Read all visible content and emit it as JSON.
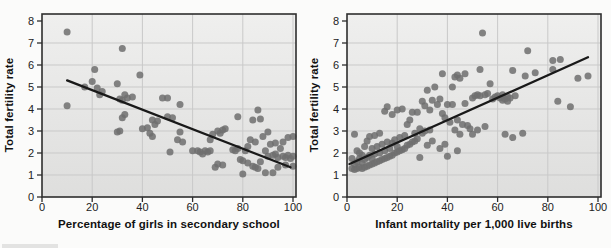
{
  "style": {
    "dot_color": "#6f6f6f",
    "trend_color": "#191919",
    "grid_color": "#c9c9c9",
    "axis_color": "#2e2e2e",
    "plot_bg_top": "#efefee",
    "plot_bg_bottom": "#dededd",
    "text_color": "#1c1c1c"
  },
  "chart_data": [
    {
      "type": "scatter",
      "title": "",
      "xlabel": "Percentage of girls in secondary school",
      "ylabel": "Total fertility rate",
      "xlim": [
        0,
        100
      ],
      "ylim": [
        0,
        8
      ],
      "xticks": [
        0,
        20,
        40,
        60,
        80,
        100
      ],
      "yticks": [
        0,
        1,
        2,
        3,
        4,
        5,
        6,
        7,
        8
      ],
      "grid": true,
      "legend": false,
      "trend_line": {
        "x1": 10,
        "y1": 5.3,
        "x2": 99,
        "y2": 1.35
      },
      "points": [
        [
          10,
          7.5
        ],
        [
          32,
          6.75
        ],
        [
          21,
          5.8
        ],
        [
          39,
          5.55
        ],
        [
          20,
          5.25
        ],
        [
          30,
          5.15
        ],
        [
          17,
          5.0
        ],
        [
          22,
          4.95
        ],
        [
          24,
          4.8
        ],
        [
          23,
          4.65
        ],
        [
          33,
          4.65
        ],
        [
          36,
          4.55
        ],
        [
          34,
          4.5
        ],
        [
          31,
          4.45
        ],
        [
          32,
          4.4
        ],
        [
          48,
          4.5
        ],
        [
          50,
          4.5
        ],
        [
          55,
          4.2
        ],
        [
          10,
          4.15
        ],
        [
          33,
          3.75
        ],
        [
          50,
          3.65
        ],
        [
          32,
          3.6
        ],
        [
          52,
          3.6
        ],
        [
          44,
          3.5
        ],
        [
          46,
          3.45
        ],
        [
          45,
          3.3
        ],
        [
          42,
          3.15
        ],
        [
          40,
          3.1
        ],
        [
          31,
          3.0
        ],
        [
          30,
          2.95
        ],
        [
          43,
          2.9
        ],
        [
          44,
          2.75
        ],
        [
          55,
          2.95
        ],
        [
          54,
          2.6
        ],
        [
          56,
          2.5
        ],
        [
          51,
          2.05
        ],
        [
          60,
          2.1
        ],
        [
          62,
          2.1
        ],
        [
          63,
          2.05
        ],
        [
          65,
          2.1
        ],
        [
          66,
          2.05
        ],
        [
          64,
          1.95
        ],
        [
          67,
          2.6
        ],
        [
          68,
          2.85
        ],
        [
          70,
          3.0
        ],
        [
          71,
          2.9
        ],
        [
          72,
          3.05
        ],
        [
          73,
          3.1
        ],
        [
          67,
          2.1
        ],
        [
          69,
          1.35
        ],
        [
          70,
          1.5
        ],
        [
          72,
          1.45
        ],
        [
          76,
          2.15
        ],
        [
          77,
          2.1
        ],
        [
          78,
          3.65
        ],
        [
          78,
          2.2
        ],
        [
          79,
          1.7
        ],
        [
          80,
          1.65
        ],
        [
          80,
          1.05
        ],
        [
          81,
          2.1
        ],
        [
          82,
          1.55
        ],
        [
          82,
          2.3
        ],
        [
          83,
          2.6
        ],
        [
          84,
          3.5
        ],
        [
          84,
          1.4
        ],
        [
          85,
          1.35
        ],
        [
          85,
          2.5
        ],
        [
          86,
          3.95
        ],
        [
          86,
          1.3
        ],
        [
          87,
          3.55
        ],
        [
          87,
          1.6
        ],
        [
          88,
          2.75
        ],
        [
          89,
          1.1
        ],
        [
          89,
          2.1
        ],
        [
          90,
          1.85
        ],
        [
          90,
          2.95
        ],
        [
          91,
          2.4
        ],
        [
          92,
          1.9
        ],
        [
          92,
          1.1
        ],
        [
          93,
          1.95
        ],
        [
          93,
          2.45
        ],
        [
          94,
          1.8
        ],
        [
          94,
          1.35
        ],
        [
          95,
          2.2
        ],
        [
          96,
          1.85
        ],
        [
          96,
          2.5
        ],
        [
          97,
          1.8
        ],
        [
          97,
          1.45
        ],
        [
          98,
          1.9
        ],
        [
          98,
          2.7
        ],
        [
          99,
          1.75
        ],
        [
          100,
          2.75
        ],
        [
          100,
          1.85
        ],
        [
          100,
          1.4
        ]
      ]
    },
    {
      "type": "scatter",
      "title": "",
      "xlabel": "Infant mortality per 1,000 live births",
      "ylabel": "Total fertility rate",
      "xlim": [
        0,
        100
      ],
      "ylim": [
        0,
        8
      ],
      "xticks": [
        0,
        20,
        40,
        60,
        80,
        100
      ],
      "yticks": [
        0,
        1,
        2,
        3,
        4,
        5,
        6,
        7,
        8
      ],
      "grid": true,
      "legend": false,
      "trend_line": {
        "x1": 1,
        "y1": 1.5,
        "x2": 96,
        "y2": 6.35
      },
      "points": [
        [
          2,
          1.3
        ],
        [
          2,
          1.75
        ],
        [
          3,
          1.25
        ],
        [
          3,
          1.5
        ],
        [
          3,
          2.85
        ],
        [
          4,
          1.3
        ],
        [
          4,
          1.6
        ],
        [
          4,
          2.1
        ],
        [
          5,
          1.35
        ],
        [
          5,
          1.75
        ],
        [
          5,
          2.0
        ],
        [
          6,
          1.3
        ],
        [
          6,
          1.55
        ],
        [
          6,
          1.9
        ],
        [
          7,
          1.35
        ],
        [
          7,
          1.7
        ],
        [
          7,
          2.3
        ],
        [
          8,
          1.4
        ],
        [
          8,
          1.8
        ],
        [
          8,
          2.55
        ],
        [
          9,
          1.45
        ],
        [
          9,
          1.9
        ],
        [
          9,
          2.75
        ],
        [
          10,
          1.5
        ],
        [
          10,
          1.75
        ],
        [
          10,
          2.2
        ],
        [
          11,
          1.55
        ],
        [
          11,
          1.95
        ],
        [
          11,
          2.8
        ],
        [
          12,
          1.6
        ],
        [
          12,
          2.3
        ],
        [
          13,
          1.65
        ],
        [
          13,
          2.0
        ],
        [
          13,
          2.9
        ],
        [
          14,
          1.7
        ],
        [
          14,
          2.4
        ],
        [
          15,
          1.75
        ],
        [
          15,
          2.1
        ],
        [
          15,
          3.9
        ],
        [
          16,
          1.8
        ],
        [
          16,
          2.5
        ],
        [
          16,
          4.1
        ],
        [
          17,
          1.85
        ],
        [
          17,
          2.2
        ],
        [
          18,
          1.9
        ],
        [
          18,
          2.45
        ],
        [
          18,
          3.75
        ],
        [
          19,
          2.0
        ],
        [
          19,
          2.6
        ],
        [
          20,
          2.05
        ],
        [
          20,
          2.3
        ],
        [
          20,
          3.95
        ],
        [
          21,
          2.1
        ],
        [
          21,
          2.7
        ],
        [
          22,
          2.15
        ],
        [
          22,
          4.0
        ],
        [
          23,
          2.2
        ],
        [
          23,
          2.8
        ],
        [
          24,
          2.35
        ],
        [
          24,
          3.3
        ],
        [
          25,
          2.4
        ],
        [
          25,
          3.5
        ],
        [
          26,
          2.5
        ],
        [
          26,
          3.85
        ],
        [
          27,
          2.55
        ],
        [
          27,
          2.9
        ],
        [
          28,
          2.65
        ],
        [
          28,
          3.85
        ],
        [
          29,
          1.8
        ],
        [
          29,
          3.1
        ],
        [
          30,
          2.9
        ],
        [
          30,
          4.35
        ],
        [
          31,
          3.0
        ],
        [
          31,
          4.15
        ],
        [
          32,
          2.35
        ],
        [
          32,
          4.85
        ],
        [
          33,
          3.05
        ],
        [
          33,
          3.95
        ],
        [
          34,
          2.55
        ],
        [
          34,
          4.4
        ],
        [
          35,
          5.0
        ],
        [
          36,
          4.2
        ],
        [
          37,
          2.2
        ],
        [
          37,
          4.45
        ],
        [
          38,
          3.8
        ],
        [
          38,
          5.6
        ],
        [
          39,
          2.4
        ],
        [
          39,
          3.6
        ],
        [
          40,
          1.85
        ],
        [
          40,
          4.2
        ],
        [
          41,
          3.4
        ],
        [
          42,
          4.2
        ],
        [
          42,
          5.0
        ],
        [
          43,
          3.05
        ],
        [
          43,
          5.45
        ],
        [
          44,
          2.1
        ],
        [
          44,
          3.5
        ],
        [
          44,
          5.55
        ],
        [
          45,
          2.85
        ],
        [
          45,
          5.4
        ],
        [
          46,
          3.3
        ],
        [
          47,
          4.25
        ],
        [
          47,
          5.6
        ],
        [
          48,
          3.25
        ],
        [
          49,
          3.1
        ],
        [
          50,
          2.85
        ],
        [
          50,
          4.5
        ],
        [
          51,
          4.6
        ],
        [
          52,
          3.05
        ],
        [
          52,
          4.65
        ],
        [
          53,
          4.6
        ],
        [
          53,
          5.8
        ],
        [
          54,
          7.45
        ],
        [
          55,
          3.2
        ],
        [
          55,
          4.65
        ],
        [
          56,
          4.7
        ],
        [
          57,
          5.15
        ],
        [
          58,
          4.45
        ],
        [
          59,
          4.55
        ],
        [
          60,
          4.6
        ],
        [
          61,
          4.5
        ],
        [
          62,
          4.4
        ],
        [
          62,
          4.65
        ],
        [
          63,
          2.85
        ],
        [
          63,
          4.45
        ],
        [
          64,
          4.55
        ],
        [
          64,
          4.35
        ],
        [
          65,
          4.5
        ],
        [
          66,
          2.7
        ],
        [
          66,
          5.75
        ],
        [
          67,
          4.6
        ],
        [
          70,
          2.9
        ],
        [
          71,
          5.5
        ],
        [
          72,
          6.65
        ],
        [
          75,
          5.65
        ],
        [
          82,
          5.8
        ],
        [
          82,
          6.2
        ],
        [
          84,
          4.35
        ],
        [
          85,
          6.25
        ],
        [
          89,
          4.1
        ],
        [
          92,
          5.4
        ],
        [
          96,
          5.5
        ]
      ]
    }
  ]
}
